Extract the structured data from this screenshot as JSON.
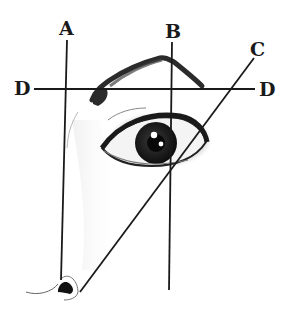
{
  "diagram": {
    "labels": {
      "a": "A",
      "b": "B",
      "c": "C",
      "d_left": "D",
      "d_right": "D"
    },
    "lines": [
      {
        "id": "A",
        "desc": "vertical line from side of nose up to start of eyebrow"
      },
      {
        "id": "B",
        "desc": "vertical line through pupil marking the eyebrow arch peak"
      },
      {
        "id": "C",
        "desc": "diagonal line from nostril past outer corner of eye to eyebrow end"
      },
      {
        "id": "D",
        "desc": "horizontal baseline of the eyebrow"
      }
    ],
    "colors": {
      "line": "#1a1a1a",
      "sketch": "#2b2b2b",
      "background": "#ffffff"
    }
  }
}
